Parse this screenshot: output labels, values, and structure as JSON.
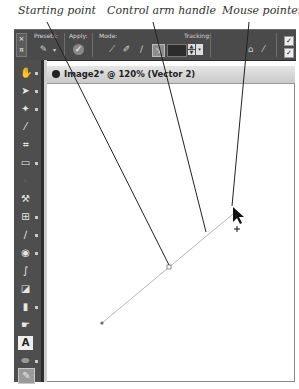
{
  "callouts": {
    "starting_point": "Starting point",
    "control_arm_handle": "Control arm handle",
    "mouse_pointer": "Mouse pointer"
  },
  "toolbar": {
    "close_icon": "×",
    "presets_label": "Presets:",
    "apply_label": "Apply:",
    "mode_label": "Mode:",
    "tracking_label": "Tracking:",
    "tracking_value": "",
    "spin_up": "▲",
    "spin_down": "▼",
    "checkbox_1": "✓",
    "checkbox_2": "✓"
  },
  "tools": [
    {
      "icon": "hand-icon",
      "glyph": "✋"
    },
    {
      "icon": "move-icon",
      "glyph": "➤"
    },
    {
      "icon": "magic-wand-icon",
      "glyph": "✦"
    },
    {
      "icon": "eyedropper-icon",
      "glyph": "⁄"
    },
    {
      "icon": "crop-icon",
      "glyph": "⌗"
    },
    {
      "icon": "shape-icon",
      "glyph": "▭"
    },
    {
      "icon": "red-eye-icon",
      "glyph": "◦"
    },
    {
      "icon": "recompose-icon",
      "glyph": "⚒"
    },
    {
      "icon": "healing-icon",
      "glyph": "⊞"
    },
    {
      "icon": "pencil-icon",
      "glyph": "∕"
    },
    {
      "icon": "brush-icon",
      "glyph": "◉"
    },
    {
      "icon": "paint-icon",
      "glyph": "∫"
    },
    {
      "icon": "paint-bucket-icon",
      "glyph": "◪"
    },
    {
      "icon": "eraser-icon",
      "glyph": "▮"
    },
    {
      "icon": "smudge-icon",
      "glyph": "☛"
    },
    {
      "icon": "text-icon",
      "glyph": "A"
    },
    {
      "icon": "gradient-icon",
      "glyph": "⬬"
    },
    {
      "icon": "pen-icon",
      "glyph": "✎"
    }
  ],
  "document": {
    "tab_title": "Image2* @ 120% (Vector 2)"
  },
  "vector": {
    "start_point": [
      102,
      323
    ],
    "control_handle": [
      169,
      267
    ],
    "end_point": [
      233,
      214
    ]
  },
  "colors": {
    "toolbar_bg": "#4a4a4a",
    "toolbox_bg": "#4e4e4e",
    "canvas_bg": "#ffffff",
    "vector_line": "#b8b8b8",
    "callout_line": "#222222"
  }
}
